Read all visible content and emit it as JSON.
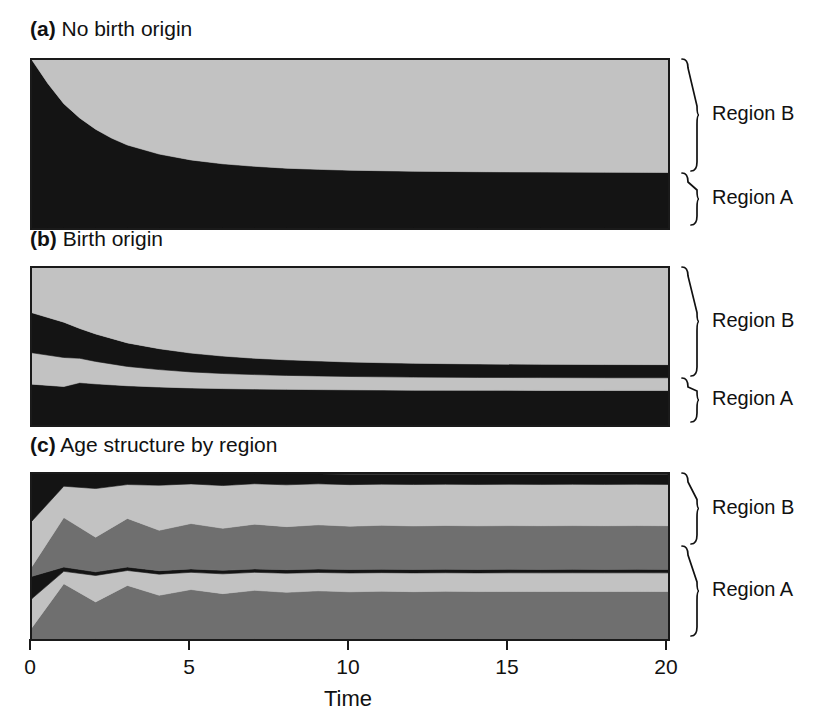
{
  "figure": {
    "width": 839,
    "height": 718,
    "background": "#ffffff"
  },
  "colors": {
    "black": "#141414",
    "dark_gray": "#6f6f6f",
    "light_gray": "#c2c2c2",
    "pale_gray": "#d6d6d6",
    "outline": "#1a1a1a",
    "text": "#111111"
  },
  "axis": {
    "title": "Time",
    "ticks": [
      {
        "value": 0,
        "label": "0"
      },
      {
        "value": 5,
        "label": "5"
      },
      {
        "value": 10,
        "label": "10"
      },
      {
        "value": 15,
        "label": "15"
      },
      {
        "value": 20,
        "label": "20"
      }
    ],
    "xlim": [
      0,
      20
    ]
  },
  "region_labels": {
    "upper": "Region B",
    "lower": "Region A"
  },
  "panels": [
    {
      "id": "a",
      "tag": "(a)",
      "title": "No birth origin",
      "plot": {
        "x": 30,
        "y": 58,
        "w": 636,
        "h": 168
      },
      "brace_upper": {
        "label": "Region B",
        "top": 58,
        "bottom": 172
      },
      "brace_lower": {
        "label": "Region A",
        "top": 172,
        "bottom": 226
      }
    },
    {
      "id": "b",
      "tag": "(b)",
      "title": "Birth origin",
      "plot": {
        "x": 30,
        "y": 266,
        "w": 636,
        "h": 157
      },
      "brace_upper": {
        "label": "Region B",
        "top": 266,
        "bottom": 377
      },
      "brace_lower": {
        "label": "Region A",
        "top": 377,
        "bottom": 423
      }
    },
    {
      "id": "c",
      "tag": "(c)",
      "title": "Age structure by region",
      "plot": {
        "x": 30,
        "y": 472,
        "w": 636,
        "h": 165
      },
      "brace_upper": {
        "label": "Region B",
        "top": 472,
        "bottom": 545
      },
      "brace_lower": {
        "label": "Region A",
        "top": 545,
        "bottom": 637
      }
    }
  ],
  "chart_data": [
    {
      "panel": "a",
      "type": "area",
      "title": "No birth origin",
      "xlabel": "Time",
      "ylabel": "",
      "xlim": [
        0,
        20
      ],
      "ylim": [
        0,
        1
      ],
      "grid": false,
      "legend": "none",
      "stack_order": "bottom-to-top",
      "x": [
        0,
        0.5,
        1,
        1.5,
        2,
        2.5,
        3,
        4,
        5,
        6,
        7,
        8,
        9,
        10,
        12,
        14,
        16,
        18,
        20
      ],
      "series": [
        {
          "name": "Region A",
          "color": "#141414",
          "values": [
            1.0,
            0.86,
            0.74,
            0.655,
            0.588,
            0.535,
            0.494,
            0.44,
            0.405,
            0.382,
            0.367,
            0.356,
            0.349,
            0.344,
            0.338,
            0.335,
            0.333,
            0.332,
            0.331
          ]
        },
        {
          "name": "Region B",
          "color": "#c2c2c2",
          "values": [
            0.0,
            0.14,
            0.26,
            0.345,
            0.412,
            0.465,
            0.506,
            0.56,
            0.595,
            0.618,
            0.633,
            0.644,
            0.651,
            0.656,
            0.662,
            0.665,
            0.667,
            0.668,
            0.669
          ]
        }
      ]
    },
    {
      "panel": "b",
      "type": "area",
      "title": "Birth origin",
      "xlabel": "Time",
      "ylabel": "",
      "xlim": [
        0,
        20
      ],
      "ylim": [
        0,
        1
      ],
      "grid": false,
      "legend": "none",
      "stack_order": "bottom-to-top",
      "x": [
        0,
        1,
        1.5,
        2,
        3,
        4,
        5,
        6,
        7,
        8,
        10,
        12,
        14,
        16,
        18,
        20
      ],
      "series": [
        {
          "name": "Region A born in A",
          "color": "#141414",
          "values": [
            0.26,
            0.245,
            0.27,
            0.262,
            0.25,
            0.242,
            0.236,
            0.232,
            0.229,
            0.227,
            0.224,
            0.222,
            0.221,
            0.2205,
            0.22,
            0.22
          ]
        },
        {
          "name": "Region A born in B",
          "color": "#c2c2c2",
          "values": [
            0.2,
            0.185,
            0.155,
            0.143,
            0.123,
            0.111,
            0.102,
            0.096,
            0.092,
            0.089,
            0.085,
            0.083,
            0.082,
            0.0815,
            0.081,
            0.081
          ]
        },
        {
          "name": "Region B born in A",
          "color": "#141414",
          "values": [
            0.255,
            0.225,
            0.19,
            0.175,
            0.15,
            0.133,
            0.12,
            0.111,
            0.104,
            0.099,
            0.092,
            0.088,
            0.086,
            0.0845,
            0.084,
            0.0835
          ]
        },
        {
          "name": "Region B born in B",
          "color": "#c2c2c2",
          "values": [
            0.285,
            0.345,
            0.385,
            0.42,
            0.477,
            0.514,
            0.542,
            0.561,
            0.575,
            0.585,
            0.599,
            0.607,
            0.611,
            0.6135,
            0.615,
            0.6155
          ]
        }
      ]
    },
    {
      "panel": "c",
      "type": "area",
      "title": "Age structure by region",
      "xlabel": "Time",
      "ylabel": "",
      "xlim": [
        0,
        20
      ],
      "ylim": [
        0,
        1
      ],
      "grid": false,
      "legend": "none",
      "stack_order": "bottom-to-top",
      "x": [
        0,
        1,
        2,
        3,
        4,
        5,
        6,
        7,
        8,
        9,
        10,
        11,
        12,
        13,
        14,
        15,
        16,
        17,
        18,
        19,
        20
      ],
      "series": [
        {
          "name": "Region A young",
          "color": "#6f6f6f",
          "values": [
            0.07,
            0.335,
            0.225,
            0.325,
            0.265,
            0.3,
            0.275,
            0.295,
            0.283,
            0.292,
            0.286,
            0.29,
            0.287,
            0.289,
            0.2875,
            0.2885,
            0.288,
            0.2885,
            0.288,
            0.2885,
            0.288
          ]
        },
        {
          "name": "Region A mid",
          "color": "#c2c2c2",
          "values": [
            0.175,
            0.075,
            0.16,
            0.09,
            0.128,
            0.104,
            0.12,
            0.109,
            0.116,
            0.111,
            0.114,
            0.112,
            0.1135,
            0.1125,
            0.113,
            0.1127,
            0.1129,
            0.1127,
            0.1129,
            0.1127,
            0.1129
          ]
        },
        {
          "name": "Region A old",
          "color": "#141414",
          "values": [
            0.135,
            0.026,
            0.022,
            0.021,
            0.021,
            0.021,
            0.021,
            0.021,
            0.021,
            0.021,
            0.021,
            0.021,
            0.021,
            0.021,
            0.021,
            0.021,
            0.021,
            0.021,
            0.021,
            0.021,
            0.021
          ]
        },
        {
          "name": "Region B young",
          "color": "#6f6f6f",
          "values": [
            0.06,
            0.3,
            0.21,
            0.295,
            0.245,
            0.275,
            0.255,
            0.271,
            0.261,
            0.268,
            0.263,
            0.266,
            0.264,
            0.2655,
            0.2645,
            0.2652,
            0.2648,
            0.2652,
            0.2648,
            0.2652,
            0.2648
          ]
        },
        {
          "name": "Region B mid",
          "color": "#c2c2c2",
          "values": [
            0.275,
            0.19,
            0.295,
            0.205,
            0.273,
            0.24,
            0.259,
            0.245,
            0.2535,
            0.2485,
            0.2515,
            0.2495,
            0.2507,
            0.2499,
            0.2504,
            0.2501,
            0.2503,
            0.2501,
            0.2503,
            0.2501,
            0.2503
          ]
        },
        {
          "name": "Region B old",
          "color": "#141414",
          "values": [
            0.285,
            0.074,
            0.088,
            0.064,
            0.068,
            0.06,
            0.07,
            0.059,
            0.0655,
            0.0595,
            0.0635,
            0.0605,
            0.0628,
            0.0611,
            0.0621,
            0.0615,
            0.062,
            0.0615,
            0.062,
            0.0615,
            0.062
          ]
        }
      ]
    }
  ]
}
